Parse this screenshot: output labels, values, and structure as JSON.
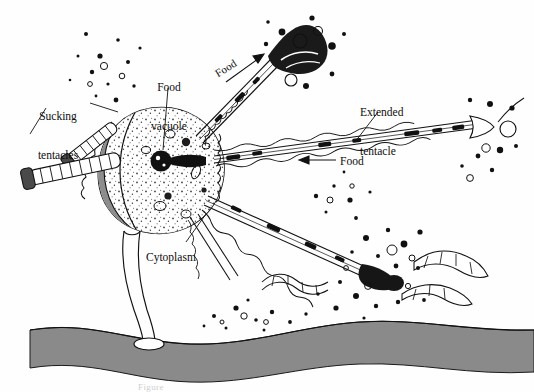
{
  "figure": {
    "kind": "biological-illustration",
    "background_color": "#fefefe",
    "ink_color": "#111111",
    "substrate_color": "#8a8a8a",
    "crescent_color": "#8d8d8d",
    "vacuole_color": "#111111"
  },
  "labels": {
    "sucking_tentacles": {
      "line1": "Sucking",
      "line2": "tentacles"
    },
    "food_vacuole": {
      "line1": "Food",
      "line2": "vacuole"
    },
    "extended_tentacle": {
      "line1": "Extended",
      "line2": "tentacle"
    },
    "cytoplasm": {
      "text": "Cytoplasm"
    },
    "food_upper": {
      "text": "Food"
    },
    "food_lower": {
      "text": "Food"
    }
  },
  "caption": {
    "text": "Figure"
  },
  "structures": [
    {
      "name": "cell-body",
      "description": "rounded stippled cell body with gray crescent on left"
    },
    {
      "name": "sucking-tentacles",
      "description": "two short segmented knob-tipped tentacles at upper left"
    },
    {
      "name": "extended-tentacle-upper-right",
      "description": "long tentacle reaching prey at top right"
    },
    {
      "name": "extended-tentacle-right",
      "description": "long horizontal tentacle with flared tip at far right"
    },
    {
      "name": "extended-tentacle-lower-right",
      "description": "tentacle with dark bulbous tip toward lower right"
    },
    {
      "name": "food-vacuole",
      "description": "dark round vacuole near center of cell"
    },
    {
      "name": "stalk",
      "description": "narrow stalk descending to attachment disc"
    },
    {
      "name": "substrate",
      "description": "gray undulating band across the bottom"
    },
    {
      "name": "prey-dark-organism",
      "description": "dark organism at top right being ingested"
    },
    {
      "name": "prey-filament",
      "description": "ribbon-like segmented filament at lower right"
    },
    {
      "name": "particle-field",
      "description": "scattered dots and circles suggesting suspended debris"
    }
  ]
}
